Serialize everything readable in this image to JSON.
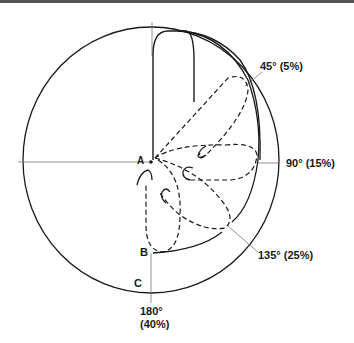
{
  "diagram": {
    "points": {
      "a": "A",
      "b": "B",
      "c": "C"
    },
    "angles": [
      {
        "id": "45",
        "label": "45° (5%)"
      },
      {
        "id": "90",
        "label": "90° (15%)"
      },
      {
        "id": "135",
        "label": "135° (25%)"
      },
      {
        "id": "180",
        "label_line1": "180°",
        "label_line2": "(40%)"
      }
    ],
    "colors": {
      "stroke": "#1a1a1a",
      "leader": "#777777"
    }
  }
}
